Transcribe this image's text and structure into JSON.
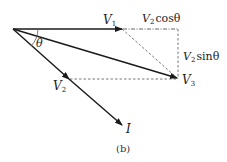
{
  "figure": {
    "caption": "(b)",
    "labels": {
      "v1": {
        "main": "V",
        "sub": "1"
      },
      "v2": {
        "main": "V",
        "sub": "2"
      },
      "v3": {
        "main": "V",
        "sub": "3"
      },
      "current": "I",
      "theta": "θ",
      "cos_component": {
        "main": "V",
        "sub": "2",
        "rest": "cosθ"
      },
      "sin_component": {
        "main": "V",
        "sub": "2",
        "rest": "sinθ"
      }
    },
    "colors": {
      "line": "#1a1a1a",
      "dashed": "#555555"
    }
  }
}
